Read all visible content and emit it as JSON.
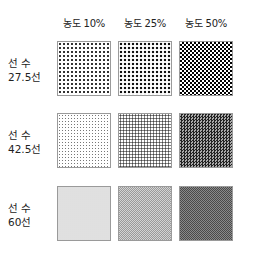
{
  "columns": [
    {
      "label": "농도 10%"
    },
    {
      "label": "농도 25%"
    },
    {
      "label": "농도 50%"
    }
  ],
  "rows": [
    {
      "label_line1": "선 수",
      "label_line2": "27.5선"
    },
    {
      "label_line1": "선 수",
      "label_line2": "42.5선"
    },
    {
      "label_line1": "선 수",
      "label_line2": "60선"
    }
  ],
  "swatches": [
    [
      {
        "density": "10%",
        "screen": "27.5선"
      },
      {
        "density": "25%",
        "screen": "27.5선"
      },
      {
        "density": "50%",
        "screen": "27.5선"
      }
    ],
    [
      {
        "density": "10%",
        "screen": "42.5선"
      },
      {
        "density": "25%",
        "screen": "42.5선"
      },
      {
        "density": "50%",
        "screen": "42.5선"
      }
    ],
    [
      {
        "density": "10%",
        "screen": "60선"
      },
      {
        "density": "25%",
        "screen": "60선"
      },
      {
        "density": "50%",
        "screen": "60선"
      }
    ]
  ]
}
